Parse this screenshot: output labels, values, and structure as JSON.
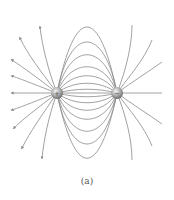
{
  "figure": {
    "caption": "(a)",
    "charges": [
      {
        "sign": "+",
        "x": 57,
        "y": 93
      },
      {
        "sign": "-",
        "x": 117,
        "y": 93
      }
    ],
    "colors": {
      "field_line": "#8a8a8a",
      "charge": "#b0b0b0"
    }
  }
}
